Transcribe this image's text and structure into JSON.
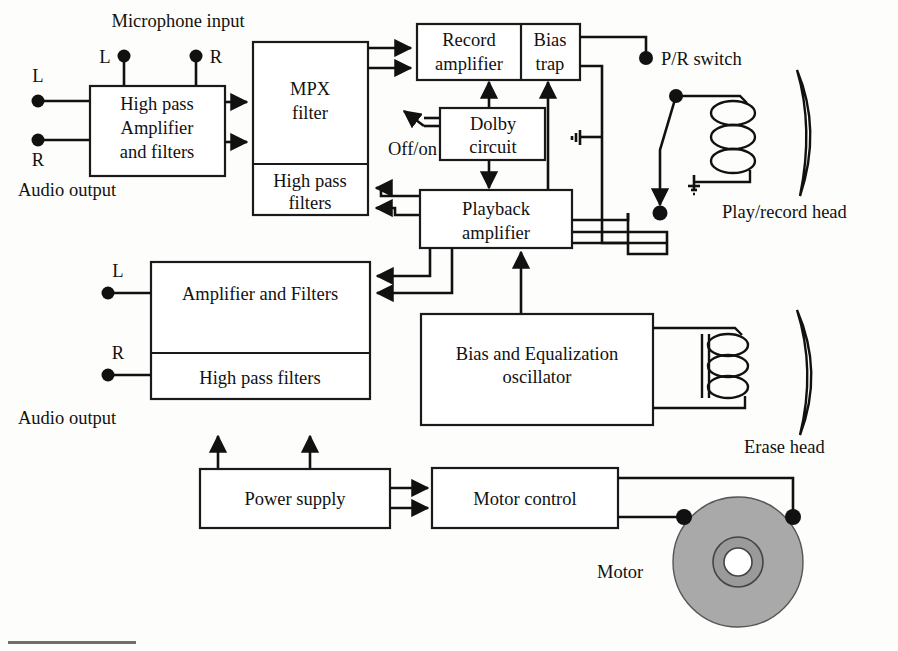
{
  "diagram": {
    "colors": {
      "line": "#111111",
      "box_fill": "#ffffff",
      "disc_fill": "#a9a9a9",
      "background": "#fdfdfb"
    },
    "blocks": [
      {
        "id": "high-pass-amplifier-and-filters",
        "lines": [
          "High pass",
          "Amplifier",
          "and filters"
        ]
      },
      {
        "id": "mpx-filter",
        "lines": [
          "MPX",
          "filter"
        ]
      },
      {
        "id": "mpx-high-pass-filters",
        "lines": [
          "High pass",
          "filters"
        ]
      },
      {
        "id": "record-amplifier",
        "lines": [
          "Record",
          "amplifier"
        ]
      },
      {
        "id": "bias-trap",
        "lines": [
          "Bias",
          "trap"
        ]
      },
      {
        "id": "dolby-circuit",
        "lines": [
          "Dolby",
          "circuit"
        ]
      },
      {
        "id": "playback-amplifier",
        "lines": [
          "Playback",
          "amplifier"
        ]
      },
      {
        "id": "output-amplifier-and-filters",
        "lines": [
          "Amplifier and Filters"
        ]
      },
      {
        "id": "output-high-pass-filters",
        "lines": [
          "High pass filters"
        ]
      },
      {
        "id": "bias-and-equalization-oscillator",
        "lines": [
          "Bias and Equalization",
          "oscillator"
        ]
      },
      {
        "id": "power-supply",
        "lines": [
          "Power supply"
        ]
      },
      {
        "id": "motor-control",
        "lines": [
          "Motor  control"
        ]
      }
    ],
    "labels": {
      "microphone_input": "Microphone input",
      "mic_left": "L",
      "mic_right": "R",
      "input_left": "L",
      "input_right": "R",
      "audio_output_top": "Audio output",
      "audio_output_bottom": "Audio output",
      "out_left": "L",
      "out_right": "R",
      "off_on": "Off/on",
      "pr_switch": "P/R switch",
      "play_record_head": "Play/record head",
      "erase_head": "Erase head",
      "motor": "Motor"
    },
    "icons": [
      "arrow-icon",
      "junction-dot-icon",
      "ground-icon",
      "coil-icon",
      "switch-icon",
      "tape-head-icon",
      "motor-disc-icon"
    ]
  }
}
